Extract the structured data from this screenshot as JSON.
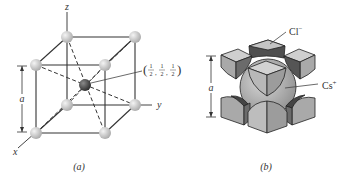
{
  "figure_a": {
    "axis_z": "z",
    "axis_y": "y",
    "axis_x": "x",
    "dimension_label": "a",
    "coord_open": "(",
    "coord_close": ")",
    "coord_num": "1",
    "coord_den": "2",
    "caption": "(a)"
  },
  "figure_b": {
    "anion_label": "Cl",
    "anion_charge": "−",
    "cation_label": "Cs",
    "cation_charge": "+",
    "dimension_label": "a",
    "caption": "(b)"
  },
  "colors": {
    "line": "#333333",
    "sphere_light": "#d8d8d8",
    "sphere_center": "#4a4a4a",
    "face_light": "#bdbdbd",
    "face_dark": "#555555",
    "big_sphere": "#b0b0b0"
  }
}
